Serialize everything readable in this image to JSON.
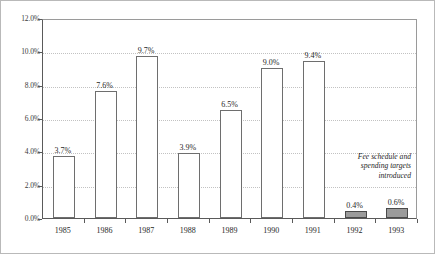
{
  "chart_data": {
    "type": "bar",
    "title": "",
    "subtitle": "",
    "xlabel": "",
    "ylabel": "",
    "categories": [
      "1985",
      "1986",
      "1987",
      "1988",
      "1989",
      "1990",
      "1991",
      "1992",
      "1993"
    ],
    "values": [
      3.7,
      7.6,
      9.7,
      3.9,
      6.5,
      9.0,
      9.4,
      0.4,
      0.6
    ],
    "value_labels": [
      "3.7%",
      "7.6%",
      "9.7%",
      "3.9%",
      "6.5%",
      "9.0%",
      "9.4%",
      "0.4%",
      "0.6%"
    ],
    "bar_styles": [
      "hollow",
      "hollow",
      "hollow",
      "hollow",
      "hollow",
      "hollow",
      "hollow",
      "filled",
      "filled"
    ],
    "ylim": [
      0,
      12
    ],
    "ytick_values": [
      0,
      2,
      4,
      6,
      8,
      10,
      12
    ],
    "ytick_labels": [
      "0.0%",
      "2.0%",
      "4.0%",
      "6.0%",
      "8.0%",
      "10.0%",
      "12.0%"
    ],
    "grid": true,
    "grid_style": "dotted",
    "legend": null,
    "annotations": [
      {
        "name": "fee-schedule-note",
        "lines": [
          "Fee schedule and",
          "spending targets",
          "introduced"
        ],
        "align": "right",
        "style": "italic"
      }
    ],
    "colors": {
      "hollow_fill": "#ffffff",
      "hollow_edge": "#6e6e6e",
      "filled_fill": "#9b9b9b",
      "filled_edge": "#4a4a4a",
      "grid": "#c2c2c2",
      "axis": "#5a5a5a",
      "text": "#1f1f1f",
      "figure_border": "#b9b9b9"
    }
  }
}
